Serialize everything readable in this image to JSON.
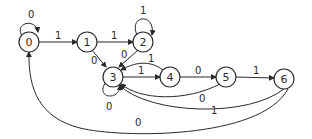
{
  "diagram": {
    "type": "state-transition-diagram",
    "nodes": [
      {
        "id": "0",
        "label": "0"
      },
      {
        "id": "1",
        "label": "1"
      },
      {
        "id": "2",
        "label": "2"
      },
      {
        "id": "3",
        "label": "3"
      },
      {
        "id": "4",
        "label": "4"
      },
      {
        "id": "5",
        "label": "5"
      },
      {
        "id": "6",
        "label": "6"
      }
    ],
    "edges": [
      {
        "from": "0",
        "to": "0",
        "label": "0"
      },
      {
        "from": "0",
        "to": "1",
        "label": "1"
      },
      {
        "from": "1",
        "to": "2",
        "label": "1"
      },
      {
        "from": "1",
        "to": "3",
        "label": "0"
      },
      {
        "from": "2",
        "to": "2",
        "label": "1"
      },
      {
        "from": "2",
        "to": "3",
        "label": "0"
      },
      {
        "from": "3",
        "to": "3",
        "label": "0"
      },
      {
        "from": "3",
        "to": "4",
        "label": "1"
      },
      {
        "from": "4",
        "to": "3",
        "label": "1"
      },
      {
        "from": "4",
        "to": "5",
        "label": "0"
      },
      {
        "from": "5",
        "to": "6",
        "label": "1"
      },
      {
        "from": "5",
        "to": "3",
        "label": "0"
      },
      {
        "from": "6",
        "to": "3",
        "label": "1"
      },
      {
        "from": "6",
        "to": "0",
        "label": "0"
      }
    ]
  }
}
